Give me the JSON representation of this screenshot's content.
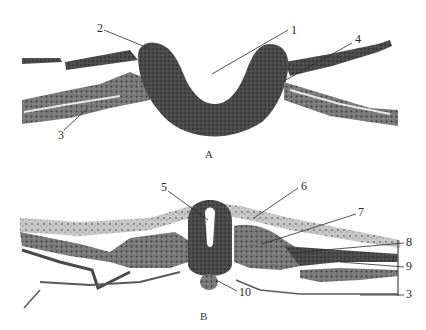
{
  "figure": {
    "panels": [
      {
        "id": "A",
        "letter": "A",
        "description": "Neural groove stage cross-section",
        "callouts": [
          {
            "num": "1",
            "x": 291,
            "y": 26
          },
          {
            "num": "2",
            "x": 97,
            "y": 24
          },
          {
            "num": "3",
            "x": 58,
            "y": 131
          },
          {
            "num": "4",
            "x": 355,
            "y": 35
          }
        ]
      },
      {
        "id": "B",
        "letter": "B",
        "description": "Neural tube stage cross-section",
        "callouts": [
          {
            "num": "5",
            "x": 162,
            "y": 183
          },
          {
            "num": "6",
            "x": 301,
            "y": 182
          },
          {
            "num": "7",
            "x": 358,
            "y": 208
          },
          {
            "num": "8",
            "x": 406,
            "y": 238
          },
          {
            "num": "9",
            "x": 406,
            "y": 262
          },
          {
            "num": "10",
            "x": 239,
            "y": 288
          },
          {
            "num": "3",
            "x": 406,
            "y": 290
          }
        ]
      }
    ],
    "colors": {
      "tissue_dark": "#3c3c3c",
      "tissue_mid": "#5a5a5a",
      "tissue_light": "#8a8a8a",
      "background": "#ffffff",
      "leader_line": "#2a2a2a"
    }
  }
}
